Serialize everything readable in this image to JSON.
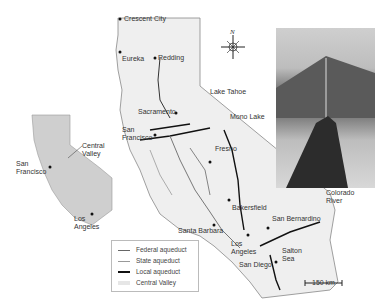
{
  "map": {
    "title": "California aqueducts",
    "cities_main": [
      {
        "name": "Crescent City",
        "x": 124,
        "y": 21
      },
      {
        "name": "Eureka",
        "x": 124,
        "y": 53
      },
      {
        "name": "Redding",
        "x": 158,
        "y": 57
      },
      {
        "name": "Lake Tahoe",
        "x": 210,
        "y": 91
      },
      {
        "name": "Sacramento",
        "x": 138,
        "y": 112
      },
      {
        "name": "Mono Lake",
        "x": 230,
        "y": 115
      },
      {
        "name": "San Francisco",
        "x": 122,
        "y": 127
      },
      {
        "name": "Fresno",
        "x": 215,
        "y": 147
      },
      {
        "name": "Bakersfield",
        "x": 232,
        "y": 205
      },
      {
        "name": "Colorado River",
        "x": 326,
        "y": 190
      },
      {
        "name": "Santa Barbara",
        "x": 178,
        "y": 229
      },
      {
        "name": "San Bernardino",
        "x": 272,
        "y": 216
      },
      {
        "name": "Los Angeles",
        "x": 231,
        "y": 241
      },
      {
        "name": "Salton Sea",
        "x": 282,
        "y": 250
      },
      {
        "name": "San Diego",
        "x": 239,
        "y": 262
      }
    ],
    "inset": {
      "labels": [
        {
          "name": "Central Valley",
          "x": 82,
          "y": 143
        },
        {
          "name": "San Francisco",
          "x": 16,
          "y": 161
        },
        {
          "name": "Los Angeles",
          "x": 74,
          "y": 216
        }
      ]
    },
    "compass": {
      "label": "N"
    },
    "legend": {
      "items": [
        {
          "label": "Federal aqueduct",
          "color": "#666666",
          "width": 1
        },
        {
          "label": "State aqueduct",
          "color": "#999999",
          "width": 1
        },
        {
          "label": "Local aqueduct",
          "color": "#111111",
          "width": 2
        },
        {
          "label": "Central Valley",
          "color": "#e6e6e6",
          "width": 4
        }
      ]
    },
    "scale_bar": {
      "label": "150 km"
    },
    "photo": {
      "description": "pipeline aqueduct crossing desert toward mountain"
    }
  }
}
